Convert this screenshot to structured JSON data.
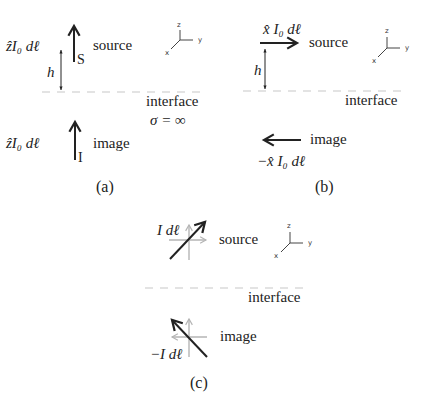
{
  "figure": {
    "panels": [
      {
        "id": "a",
        "caption": "(a)",
        "source_label": "source",
        "source_current": "ẑI₀ dℓ",
        "source_marker": "S",
        "image_label": "image",
        "image_current": "ẑI₀ dℓ",
        "image_marker": "I",
        "height_label": "h",
        "interface_label": "interface",
        "condition": "σ = ∞",
        "axes": {
          "x": "x",
          "y": "y",
          "z": "z"
        }
      },
      {
        "id": "b",
        "caption": "(b)",
        "source_label": "source",
        "source_current": "x̂ I₀ dℓ",
        "image_label": "image",
        "image_current": "−x̂ I₀ dℓ",
        "height_label": "h",
        "interface_label": "interface",
        "axes": {
          "x": "x",
          "y": "y",
          "z": "z"
        }
      },
      {
        "id": "c",
        "caption": "(c)",
        "source_label": "source",
        "source_current": "I dℓ",
        "image_label": "image",
        "image_current": "−I dℓ",
        "interface_label": "interface",
        "axes": {
          "x": "x",
          "y": "y",
          "z": "z"
        }
      }
    ],
    "colors": {
      "arrow": "#222222",
      "component_arrow": "#b5b5b5",
      "dashed_line": "#c8c8c8"
    }
  }
}
